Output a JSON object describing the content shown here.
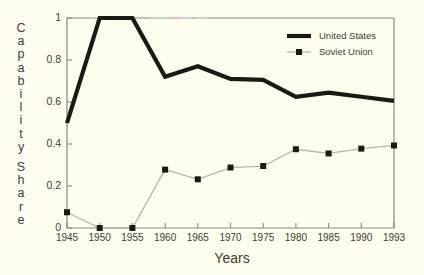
{
  "chart_data": {
    "type": "line",
    "title": "",
    "xlabel": "Years",
    "ylabel": "Capability Share",
    "ylabel_letters": [
      "C",
      "a",
      "p",
      "a",
      "b",
      "i",
      "l",
      "i",
      "t",
      "y",
      "",
      "S",
      "h",
      "a",
      "r",
      "e"
    ],
    "categories": [
      "1945",
      "1950",
      "1955",
      "1960",
      "1965",
      "1970",
      "1975",
      "1980",
      "1985",
      "1990",
      "1993"
    ],
    "x": [
      1945,
      1950,
      1955,
      1960,
      1965,
      1970,
      1975,
      1980,
      1985,
      1990,
      1993
    ],
    "xlim": [
      1945,
      1993
    ],
    "ylim": [
      0,
      1
    ],
    "yticks": [
      "0",
      "0.2",
      "0.4",
      "0.6",
      "0.8",
      "1"
    ],
    "ytick_values": [
      0,
      0.2,
      0.4,
      0.6,
      0.8,
      1
    ],
    "grid": false,
    "legend_position": "top-right",
    "series": [
      {
        "name": "United States",
        "values": [
          0.5,
          1.0,
          1.0,
          0.72,
          0.77,
          0.71,
          0.705,
          0.625,
          0.645,
          0.625,
          0.605
        ],
        "color": "#1a1a14",
        "style": "thick-line",
        "markers": false
      },
      {
        "name": "Soviet Union",
        "values": [
          0.075,
          0.0,
          0.0,
          0.278,
          0.232,
          0.288,
          0.295,
          0.375,
          0.355,
          0.378,
          0.393
        ],
        "color": "#1a1a14",
        "line_color": "#b8b8a8",
        "style": "thin-line-with-square-markers",
        "markers": true
      }
    ],
    "legend": [
      {
        "label": "United States",
        "swatch": "thick-line"
      },
      {
        "label": "Soviet Union",
        "swatch": "thin-line-square-marker"
      }
    ],
    "colors": {
      "background": "#fdfdee",
      "axis": "#8a8a78",
      "text": "#3d3d34",
      "series_us": "#1a1a14",
      "series_su_line": "#b8b8a8",
      "series_su_marker": "#1a1a14"
    }
  }
}
